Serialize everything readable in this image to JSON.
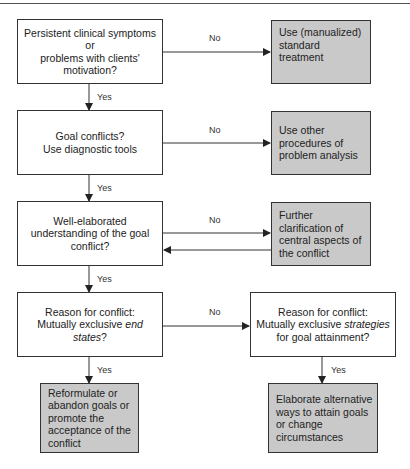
{
  "nodes": {
    "q1": {
      "lines": [
        "Persistent clinical symptoms",
        "or",
        "problems with clients'",
        "motivation?"
      ]
    },
    "a1": {
      "lines": [
        "Use (manualized)",
        "standard",
        "treatment"
      ]
    },
    "q2": {
      "lines": [
        "Goal conflicts?",
        "Use diagnostic tools"
      ]
    },
    "a2": {
      "lines": [
        "Use other",
        "procedures of",
        "problem analysis"
      ]
    },
    "q3": {
      "lines": [
        "Well-elaborated",
        "understanding of the goal",
        "conflict?"
      ]
    },
    "a3": {
      "lines": [
        "Further",
        "clarification of",
        "central aspects of",
        "the conflict"
      ]
    },
    "q4": {
      "line1": "Reason for conflict:",
      "line2_prefix": "Mutually exclusive ",
      "line2_italic": "end",
      "line3_italic": "states",
      "line3_suffix": "?"
    },
    "q5": {
      "line1": "Reason for conflict:",
      "line2_prefix": "Mutually exclusive ",
      "line2_italic": "strategies",
      "line3": "for goal attainment?"
    },
    "a4": {
      "lines": [
        "Reformulate or",
        "abandon goals or",
        "promote the",
        "acceptance of the",
        "conflict"
      ]
    },
    "a5": {
      "lines": [
        "Elaborate alternative",
        "ways to attain goals",
        "or change",
        "circumstances"
      ]
    }
  },
  "edge_labels": {
    "yes": "Yes",
    "no": "No"
  },
  "colors": {
    "action_fill": "#c9c9c9",
    "decision_fill": "#ffffff",
    "stroke": "#333333"
  }
}
